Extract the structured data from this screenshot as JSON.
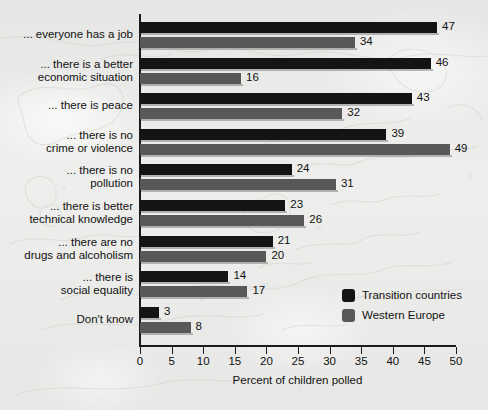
{
  "chart_data": {
    "type": "bar",
    "orientation": "horizontal",
    "title": "",
    "xlabel": "Percent of children polled",
    "ylabel": "",
    "xlim": [
      0,
      50
    ],
    "xticks": [
      0,
      5,
      10,
      15,
      20,
      25,
      30,
      35,
      40,
      45,
      50
    ],
    "grid": false,
    "legend_position": "middle-right",
    "categories": [
      "... everyone has a job",
      "... there is a better\neconomic situation",
      "... there is peace",
      "... there is no\ncrime or violence",
      "... there is no\npollution",
      "... there is better\ntechnical knowledge",
      "... there are no\ndrugs and alcoholism",
      "... there is\nsocial equality",
      "Don't know"
    ],
    "series": [
      {
        "name": "Transition countries",
        "color": "#141414",
        "values": [
          47,
          46,
          43,
          39,
          24,
          23,
          21,
          14,
          3
        ]
      },
      {
        "name": "Western Europe",
        "color": "#585858",
        "values": [
          34,
          16,
          32,
          49,
          31,
          26,
          20,
          17,
          8
        ]
      }
    ]
  },
  "colors": {
    "transition_countries": "#141414",
    "western_europe": "#585858",
    "background": "#e9e9e7",
    "axis": "#1b1b1b",
    "text": "#111111"
  }
}
